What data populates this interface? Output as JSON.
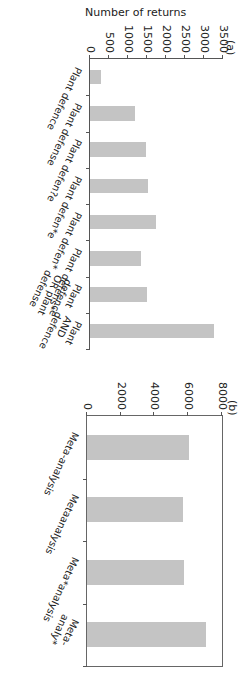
{
  "chart_data": [
    {
      "panel": "(a)",
      "type": "bar",
      "categories": [
        "Plant defence",
        "Plant defense",
        "Plant defen?e",
        "Plant defen*e",
        "Plant defen*",
        "Plant defens*",
        "Plant defence OR plant defense",
        "Plant AND defence"
      ],
      "values": [
        290,
        1180,
        1470,
        1530,
        1730,
        1340,
        1500,
        3260
      ],
      "ylabel": "Number of returns",
      "xlabel": "",
      "ylim": [
        0,
        3500
      ],
      "yticks": [
        "0",
        "500",
        "1000",
        "1500",
        "2000",
        "2500",
        "3000",
        "3500"
      ],
      "grid": false
    },
    {
      "panel": "(b)",
      "type": "bar",
      "categories": [
        "Meta-analysis",
        "Metaanalysis",
        "Meta*analysis",
        "Meta-analy*"
      ],
      "values": [
        6050,
        5700,
        5750,
        7050
      ],
      "ylabel": "",
      "xlabel": "",
      "ylim": [
        0,
        8000
      ],
      "yticks": [
        "0",
        "2000",
        "4000",
        "6000",
        "8000"
      ],
      "grid": false
    }
  ],
  "panel_a": {
    "label": "(a)",
    "ylabel": "Number of returns",
    "yticks": [
      "0",
      "500",
      "1000",
      "1500",
      "2000",
      "2500",
      "3000",
      "3500"
    ],
    "categories": [
      "Plant defence",
      "Plant defense",
      "Plant defen?e",
      "Plant defen*e",
      "Plant defen*",
      "Plant defens*",
      "Plant defence\nOR plant defense",
      "Plant AND\ndefence"
    ]
  },
  "panel_b": {
    "label": "(b)",
    "yticks": [
      "0",
      "2000",
      "4000",
      "6000",
      "8000"
    ],
    "categories": [
      "Meta-analysis",
      "Metaanalysis",
      "Meta*analysis",
      "Meta-analy*"
    ]
  }
}
